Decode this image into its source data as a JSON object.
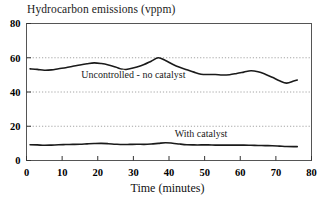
{
  "chart_data": {
    "type": "line",
    "title": "Hydrocarbon emissions (vppm)",
    "xlabel": "Time (minutes)",
    "ylabel": "",
    "xlim": [
      0,
      80
    ],
    "ylim": [
      0,
      80
    ],
    "xticks": [
      0,
      10,
      20,
      30,
      40,
      50,
      60,
      70,
      80
    ],
    "yticks": [
      0,
      20,
      40,
      60,
      80
    ],
    "xtick_labels": [
      "0",
      "10",
      "20",
      "30",
      "40",
      "50",
      "60",
      "70",
      "80"
    ],
    "ytick_labels": [
      "0",
      "20",
      "40",
      "60",
      "80"
    ],
    "grid": "horizontal-dotted",
    "legend_position": "inline-annotations",
    "line_color": "#1a1a1a",
    "series": [
      {
        "name": "Uncontrolled - no catalyst",
        "label_x": 30,
        "label_y": 48,
        "x": [
          1,
          3,
          5,
          7,
          9,
          11,
          13,
          15,
          17,
          19,
          21,
          23,
          25,
          27,
          29,
          31,
          33,
          35,
          37,
          39,
          41,
          43,
          45,
          47,
          49,
          51,
          53,
          55,
          57,
          59,
          61,
          63,
          65,
          67,
          69,
          71,
          73,
          75,
          76
        ],
        "values": [
          53.5,
          53.2,
          52.7,
          52.9,
          53.6,
          54.2,
          55.0,
          55.8,
          56.5,
          57.0,
          56.6,
          55.8,
          54.6,
          53.2,
          53.6,
          54.6,
          56.0,
          58.0,
          60.0,
          58.4,
          56.2,
          54.4,
          53.0,
          51.6,
          50.4,
          50.2,
          50.2,
          49.9,
          50.1,
          50.8,
          51.6,
          52.4,
          51.8,
          50.4,
          48.6,
          46.6,
          45.2,
          46.4,
          47.0
        ]
      },
      {
        "name": "With catalyst",
        "label_x": 49,
        "label_y": 13.5,
        "x": [
          1,
          3,
          5,
          7,
          9,
          11,
          13,
          15,
          17,
          19,
          21,
          23,
          25,
          27,
          29,
          31,
          33,
          35,
          37,
          39,
          41,
          43,
          45,
          47,
          49,
          51,
          53,
          55,
          57,
          59,
          61,
          63,
          65,
          67,
          69,
          71,
          73,
          75,
          76
        ],
        "values": [
          9.2,
          9.1,
          8.9,
          9.0,
          9.2,
          9.3,
          9.4,
          9.5,
          9.7,
          9.9,
          10.0,
          9.8,
          9.5,
          9.3,
          9.4,
          9.5,
          9.4,
          9.6,
          10.0,
          10.4,
          10.1,
          9.6,
          9.2,
          9.1,
          9.1,
          9.1,
          9.0,
          9.0,
          9.0,
          9.0,
          9.0,
          8.9,
          8.8,
          8.7,
          8.6,
          8.4,
          8.2,
          8.1,
          8.1
        ]
      }
    ]
  }
}
